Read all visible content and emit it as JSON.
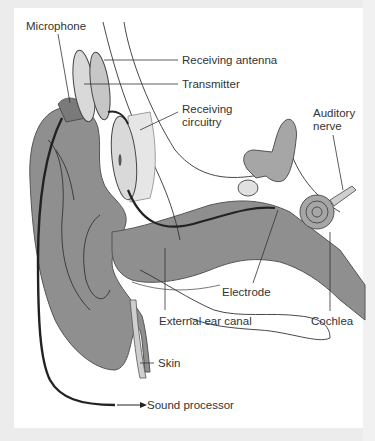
{
  "diagram": {
    "labels": {
      "microphone": "Microphone",
      "receiving_antenna": "Receiving antenna",
      "transmitter": "Transmitter",
      "receiving_circuitry_1": "Receiving",
      "receiving_circuitry_2": "circuitry",
      "auditory_nerve_1": "Auditory",
      "auditory_nerve_2": "nerve",
      "electrode": "Electrode",
      "external_ear_canal": "External ear canal",
      "cochlea": "Cochlea",
      "skin": "Skin",
      "sound_processor": "Sound processor"
    },
    "colors": {
      "background": "#ececec",
      "panel": "#ffffff",
      "tissue_dark": "#8f8f8f",
      "tissue_mid": "#a6a6a6",
      "tissue_light": "#cfcfcf",
      "device_light": "#d9d9d9",
      "cable": "#222222",
      "text": "#333333"
    }
  }
}
